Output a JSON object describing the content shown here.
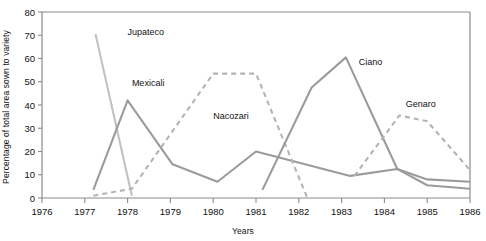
{
  "chart_data": {
    "type": "line",
    "title": "",
    "xlabel": "Years",
    "ylabel": "Percentage of total area sown to variety",
    "xlim": [
      1976,
      1986
    ],
    "ylim": [
      0,
      80
    ],
    "yticks": [
      0,
      10,
      20,
      30,
      40,
      50,
      60,
      70,
      80
    ],
    "xticks": [
      1976,
      1977,
      1978,
      1979,
      1980,
      1981,
      1982,
      1983,
      1984,
      1985,
      1986
    ],
    "grid": false,
    "legend_position": "inline-annotations",
    "series": [
      {
        "name": "Jupateco",
        "style": "solid",
        "color": "#c2c2c2",
        "label_x": 1978.0,
        "label_y": 70,
        "points": [
          {
            "x": 1977.25,
            "y": 70.5
          },
          {
            "x": 1978.1,
            "y": 1.0
          }
        ]
      },
      {
        "name": "Mexicali",
        "style": "solid",
        "color": "#9b9b9b",
        "label_x": 1978.1,
        "label_y": 48,
        "points": [
          {
            "x": 1977.2,
            "y": 3.5
          },
          {
            "x": 1978.0,
            "y": 42.0
          },
          {
            "x": 1979.05,
            "y": 14.5
          },
          {
            "x": 1980.1,
            "y": 7.0
          },
          {
            "x": 1981.0,
            "y": 20.0
          },
          {
            "x": 1983.2,
            "y": 9.5
          },
          {
            "x": 1984.3,
            "y": 12.5
          },
          {
            "x": 1985.0,
            "y": 8.0
          },
          {
            "x": 1986.0,
            "y": 7.0
          }
        ]
      },
      {
        "name": "Nacozari",
        "style": "dashed",
        "color": "#b4b4b4",
        "label_x": 1980.0,
        "label_y": 34,
        "points": [
          {
            "x": 1977.2,
            "y": 1.0
          },
          {
            "x": 1978.1,
            "y": 4.0
          },
          {
            "x": 1980.0,
            "y": 53.5
          },
          {
            "x": 1981.0,
            "y": 53.5
          },
          {
            "x": 1982.2,
            "y": 0.0
          }
        ]
      },
      {
        "name": "Ciano",
        "style": "solid",
        "color": "#9b9b9b",
        "label_x": 1983.4,
        "label_y": 57,
        "points": [
          {
            "x": 1981.15,
            "y": 3.5
          },
          {
            "x": 1982.3,
            "y": 47.5
          },
          {
            "x": 1983.1,
            "y": 60.5
          },
          {
            "x": 1984.3,
            "y": 12.5
          },
          {
            "x": 1985.0,
            "y": 5.5
          },
          {
            "x": 1986.0,
            "y": 4.0
          }
        ]
      },
      {
        "name": "Genaro",
        "style": "dashed",
        "color": "#b4b4b4",
        "label_x": 1984.5,
        "label_y": 39,
        "points": [
          {
            "x": 1983.3,
            "y": 9.5
          },
          {
            "x": 1984.35,
            "y": 35.5
          },
          {
            "x": 1985.0,
            "y": 33.0
          },
          {
            "x": 1986.0,
            "y": 12.0
          }
        ]
      }
    ]
  },
  "axes": {
    "x_label": "Years",
    "y_label": "Percentage of total area sown to variety",
    "x_tick_labels": [
      "1976",
      "1977",
      "1978",
      "1979",
      "1980",
      "1981",
      "1982",
      "1983",
      "1984",
      "1985",
      "1986"
    ],
    "y_tick_labels": [
      "0",
      "10",
      "20",
      "30",
      "40",
      "50",
      "60",
      "70",
      "80"
    ]
  },
  "annotations": {
    "jupateco": "Jupateco",
    "mexicali": "Mexicali",
    "nacozari": "Nacozari",
    "ciano": "Ciano",
    "genaro": "Genaro"
  }
}
